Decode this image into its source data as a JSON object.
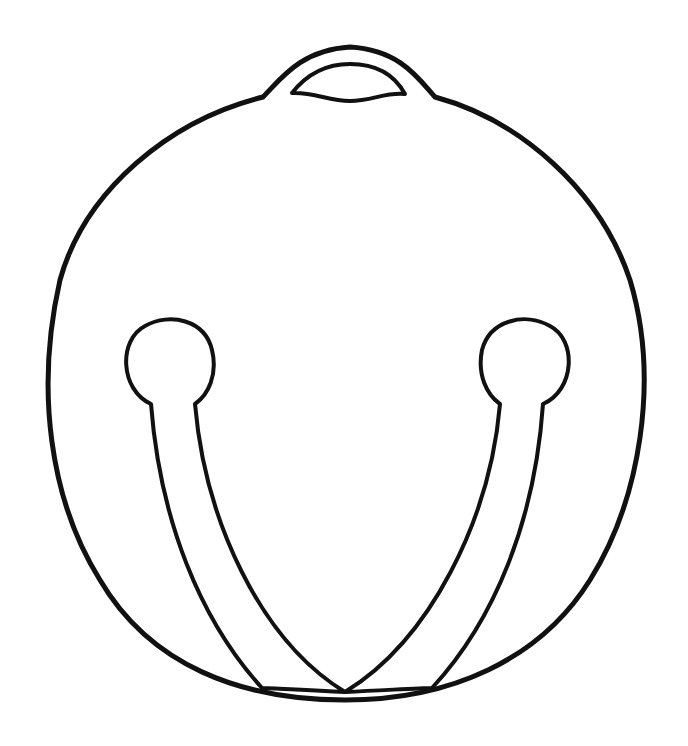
{
  "image": {
    "subject": "jingle bell line drawing",
    "colors": {
      "background": "#ffffff",
      "stroke": "#111111"
    }
  }
}
